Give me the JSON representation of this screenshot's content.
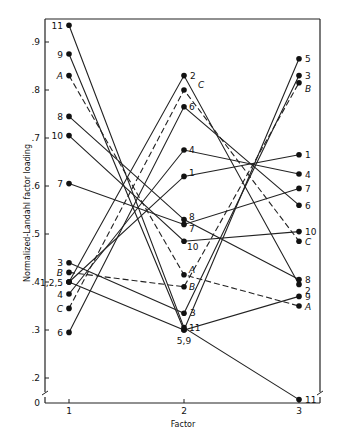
{
  "chart_data": {
    "type": "line",
    "title": "",
    "xlabel": "Factor",
    "ylabel": "Normalized-Landahl factor loading",
    "categories": [
      "1",
      "2",
      "3"
    ],
    "x": [
      1,
      2,
      3
    ],
    "yticks": [
      ".2",
      ".3",
      ".4",
      ".5",
      ".6",
      ".7",
      ".8",
      ".9"
    ],
    "ytick_values": [
      0.2,
      0.3,
      0.4,
      0.5,
      0.6,
      0.7,
      0.8,
      0.9
    ],
    "y_zero_label": "0",
    "ylim": [
      0,
      0.95
    ],
    "axis_break": true,
    "grid": false,
    "legend": "none (series labeled at points)",
    "series": [
      {
        "name": "1",
        "style": "solid",
        "values": [
          0.4,
          0.62,
          0.665
        ]
      },
      {
        "name": "2",
        "style": "solid",
        "values": [
          0.4,
          0.83,
          0.395
        ]
      },
      {
        "name": "3",
        "style": "solid",
        "values": [
          0.44,
          0.335,
          0.83
        ]
      },
      {
        "name": "4",
        "style": "solid",
        "values": [
          0.375,
          0.675,
          0.625
        ]
      },
      {
        "name": "5",
        "style": "solid",
        "values": [
          0.4,
          0.3,
          0.865
        ]
      },
      {
        "name": "6",
        "style": "solid",
        "values": [
          0.295,
          0.765,
          0.56
        ]
      },
      {
        "name": "7",
        "style": "solid",
        "values": [
          0.605,
          0.52,
          0.595
        ]
      },
      {
        "name": "8",
        "style": "solid",
        "values": [
          0.745,
          0.53,
          0.405
        ]
      },
      {
        "name": "9",
        "style": "solid",
        "values": [
          0.875,
          0.3,
          0.37
        ]
      },
      {
        "name": "10",
        "style": "solid",
        "values": [
          0.705,
          0.485,
          0.505
        ]
      },
      {
        "name": "11",
        "style": "solid",
        "values": [
          0.935,
          0.305,
          0.02
        ]
      },
      {
        "name": "A",
        "style": "dashed",
        "values": [
          0.83,
          0.415,
          0.35
        ]
      },
      {
        "name": "B",
        "style": "dashed",
        "values": [
          0.42,
          0.39,
          0.815
        ]
      },
      {
        "name": "C",
        "style": "dashed",
        "values": [
          0.345,
          0.8,
          0.485
        ]
      }
    ],
    "point_labels": {
      "factor1": [
        "11",
        "9",
        "A",
        "8",
        "10",
        "7",
        "3",
        "B",
        "1,2,5",
        "4",
        "C",
        "6"
      ],
      "factor2": [
        "2",
        "C",
        "6",
        "4",
        "1",
        "8",
        "7",
        "10",
        "A",
        "B",
        "3",
        "11",
        "5,9"
      ],
      "factor3": [
        "5",
        "3",
        "B",
        "1",
        "4",
        "7",
        "6",
        "10",
        "C",
        "8",
        "2",
        "9",
        "A",
        "11"
      ]
    }
  }
}
